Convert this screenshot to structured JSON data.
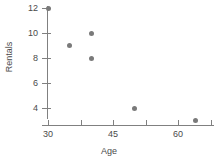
{
  "chart_data": {
    "type": "scatter",
    "title": "",
    "xlabel": "Age",
    "ylabel": "Rentals",
    "xlim": [
      28,
      70
    ],
    "ylim": [
      2,
      12.8
    ],
    "grid": false,
    "legend": null,
    "marker_color": "#7a7a7a",
    "axis_color": "#808080",
    "x_ticks": [
      30,
      37.5,
      45,
      52.5,
      60,
      67.5
    ],
    "x_tick_labels": [
      "30",
      "",
      "45",
      "",
      "60",
      ""
    ],
    "y_ticks": [
      4,
      6,
      8,
      10,
      12
    ],
    "y_tick_labels": [
      "4",
      "6",
      "8",
      "10",
      "12"
    ],
    "points": [
      {
        "x": 30,
        "y": 12
      },
      {
        "x": 35,
        "y": 9
      },
      {
        "x": 40,
        "y": 10
      },
      {
        "x": 40,
        "y": 8
      },
      {
        "x": 50,
        "y": 4
      },
      {
        "x": 64,
        "y": 3
      }
    ]
  }
}
